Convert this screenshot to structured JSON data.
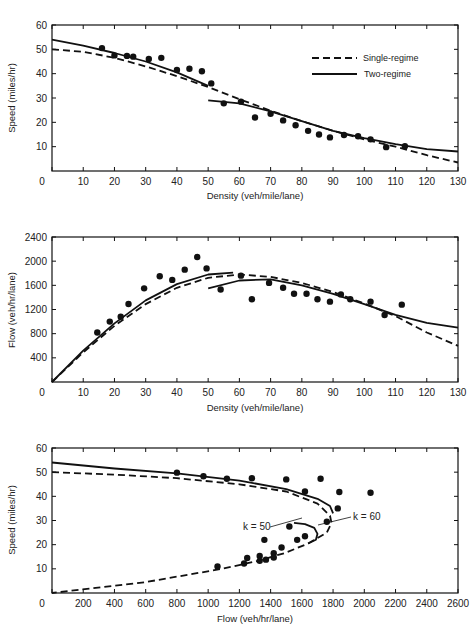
{
  "chart_data": [
    {
      "type": "scatter",
      "title": "",
      "xlabel": "Density (veh/mile/lane)",
      "ylabel": "Speed (miles/hr)",
      "xlim": [
        0,
        130
      ],
      "ylim": [
        0,
        60
      ],
      "xticks": [
        0,
        10,
        20,
        30,
        40,
        50,
        60,
        70,
        80,
        90,
        100,
        110,
        120,
        130
      ],
      "yticks": [
        10,
        20,
        30,
        40,
        50,
        60
      ],
      "grid": false,
      "legend": {
        "position": "upper right",
        "entries": [
          "Single-regime",
          "Two-regime"
        ]
      },
      "observed_points": [
        [
          16,
          50.5
        ],
        [
          20,
          47.5
        ],
        [
          24,
          47.3
        ],
        [
          26,
          47
        ],
        [
          31,
          46
        ],
        [
          35,
          46.5
        ],
        [
          40,
          41.5
        ],
        [
          44,
          42
        ],
        [
          48,
          41
        ],
        [
          51,
          36
        ],
        [
          55,
          27.8
        ],
        [
          60.5,
          28.5
        ],
        [
          65,
          22
        ],
        [
          70,
          23.5
        ],
        [
          74,
          20.8
        ],
        [
          78,
          18.8
        ],
        [
          82,
          16.5
        ],
        [
          85.5,
          15
        ],
        [
          89,
          13.8
        ],
        [
          93.5,
          14.8
        ],
        [
          98,
          14.3
        ],
        [
          102,
          13
        ],
        [
          107,
          9.8
        ],
        [
          113,
          10.2
        ]
      ],
      "series": [
        {
          "name": "Single-regime",
          "style": "dashed",
          "x": [
            0,
            10,
            20,
            30,
            40,
            50,
            60,
            70,
            80,
            90,
            100,
            110,
            120,
            130
          ],
          "y": [
            50,
            49,
            46.5,
            43,
            39,
            34.5,
            29.5,
            24.8,
            20.5,
            16.5,
            13,
            10,
            6.5,
            3.5
          ]
        },
        {
          "name": "Two-regime (uncongested)",
          "style": "solid",
          "x": [
            0,
            10,
            20,
            30,
            40,
            50
          ],
          "y": [
            54,
            51.5,
            48.5,
            45,
            40.5,
            35
          ]
        },
        {
          "name": "Two-regime (congested)",
          "style": "solid",
          "x": [
            50,
            60,
            70,
            80,
            90,
            100,
            110,
            120,
            130
          ],
          "y": [
            29,
            27.8,
            24.5,
            20.5,
            16.5,
            13.5,
            11,
            9,
            8
          ]
        }
      ]
    },
    {
      "type": "scatter",
      "title": "",
      "xlabel": "Density (veh/mile/lane)",
      "ylabel": "Flow (veh/hr/lane)",
      "xlim": [
        0,
        130
      ],
      "ylim": [
        0,
        2400
      ],
      "xticks": [
        0,
        10,
        20,
        30,
        40,
        50,
        60,
        70,
        80,
        90,
        100,
        110,
        120,
        130
      ],
      "yticks": [
        400,
        800,
        1200,
        1600,
        2000,
        2400
      ],
      "grid": false,
      "observed_points": [
        [
          14.5,
          820
        ],
        [
          18.5,
          1000
        ],
        [
          22,
          1080
        ],
        [
          24.5,
          1290
        ],
        [
          29.5,
          1550
        ],
        [
          34.5,
          1750
        ],
        [
          38.5,
          1690
        ],
        [
          42.5,
          1860
        ],
        [
          46.5,
          2070
        ],
        [
          49.5,
          1880
        ],
        [
          54,
          1530
        ],
        [
          60.5,
          1760
        ],
        [
          64,
          1370
        ],
        [
          69.5,
          1640
        ],
        [
          74,
          1560
        ],
        [
          77.5,
          1460
        ],
        [
          81.5,
          1460
        ],
        [
          85,
          1370
        ],
        [
          89,
          1330
        ],
        [
          92.5,
          1450
        ],
        [
          95.5,
          1370
        ],
        [
          102,
          1330
        ],
        [
          106.5,
          1110
        ],
        [
          112,
          1280
        ]
      ],
      "series": [
        {
          "name": "Single-regime",
          "style": "dashed",
          "x": [
            0,
            10,
            20,
            30,
            40,
            50,
            60,
            70,
            80,
            90,
            100,
            110,
            120,
            130
          ],
          "y": [
            0,
            490,
            930,
            1290,
            1560,
            1725,
            1780,
            1740,
            1640,
            1490,
            1300,
            1090,
            820,
            600
          ]
        },
        {
          "name": "Two-regime (uncongested)",
          "style": "solid",
          "x": [
            0,
            10,
            20,
            30,
            40,
            50,
            58
          ],
          "y": [
            0,
            520,
            970,
            1350,
            1620,
            1780,
            1810
          ]
        },
        {
          "name": "Two-regime (congested)",
          "style": "solid",
          "x": [
            50,
            60,
            70,
            80,
            90,
            100,
            110,
            120,
            130
          ],
          "y": [
            1550,
            1680,
            1700,
            1600,
            1460,
            1290,
            1110,
            980,
            900
          ]
        }
      ]
    },
    {
      "type": "scatter",
      "title": "",
      "xlabel": "Flow (veh/hr/lane)",
      "ylabel": "Speed (miles/hr)",
      "xlim": [
        0,
        2600
      ],
      "ylim": [
        0,
        60
      ],
      "xticks": [
        0,
        200,
        400,
        600,
        800,
        1000,
        1200,
        1400,
        1600,
        1800,
        2000,
        2200,
        2400,
        2600
      ],
      "yticks": [
        10,
        20,
        30,
        40,
        50,
        60
      ],
      "grid": false,
      "annotations": [
        {
          "text": "k = 50",
          "x": 1250,
          "y": 27.5
        },
        {
          "text": "k = 60",
          "x": 1880,
          "y": 31.5
        }
      ],
      "observed_points": [
        [
          800,
          49.8
        ],
        [
          970,
          48.3
        ],
        [
          1120,
          47.3
        ],
        [
          1280,
          47.5
        ],
        [
          1500,
          47
        ],
        [
          1720,
          47.3
        ],
        [
          1620,
          42
        ],
        [
          1840,
          41.8
        ],
        [
          2040,
          41.5
        ],
        [
          1830,
          35
        ],
        [
          1760,
          29.5
        ],
        [
          1520,
          27.5
        ],
        [
          1360,
          22
        ],
        [
          1570,
          22
        ],
        [
          1620,
          23.5
        ],
        [
          1470,
          18.8
        ],
        [
          1420,
          16.5
        ],
        [
          1330,
          15.3
        ],
        [
          1250,
          14.5
        ],
        [
          1230,
          12.2
        ],
        [
          1330,
          13.3
        ],
        [
          1370,
          13.8
        ],
        [
          1420,
          14.7
        ],
        [
          1060,
          11
        ]
      ],
      "series": [
        {
          "name": "Single-regime",
          "style": "dashed",
          "x": [
            0,
            400,
            800,
            1200,
            1500,
            1700,
            1780,
            1790,
            1760,
            1640,
            1490,
            1300,
            1090,
            600,
            0
          ],
          "y": [
            50,
            49,
            47.5,
            45,
            42,
            37,
            32,
            29,
            25,
            20.5,
            16.5,
            13,
            10,
            4.5,
            0
          ]
        },
        {
          "name": "Two-regime (uncongested)",
          "style": "solid",
          "x": [
            0,
            400,
            800,
            1200,
            1500,
            1700,
            1780,
            1800
          ],
          "y": [
            54,
            51.5,
            49.5,
            46.5,
            43,
            39,
            36,
            33
          ]
        },
        {
          "name": "Two-regime (congested)",
          "style": "solid",
          "x": [
            1550,
            1620,
            1680,
            1700,
            1690,
            1640
          ],
          "y": [
            29,
            28.5,
            27,
            24.5,
            22,
            20.5
          ]
        }
      ]
    }
  ],
  "labels": {
    "chart1": {
      "xlabel": "Density (veh/mile/lane)",
      "ylabel": "Speed (miles/hr)",
      "legend_single": "Single-regime",
      "legend_two": "Two-regime"
    },
    "chart2": {
      "xlabel": "Density (veh/mile/lane)",
      "ylabel": "Flow (veh/hr/lane)"
    },
    "chart3": {
      "xlabel": "Flow (veh/hr/lane)",
      "ylabel": "Speed (miles/hr)",
      "annot_k50": "k = 50",
      "annot_k60": "k = 60"
    }
  }
}
